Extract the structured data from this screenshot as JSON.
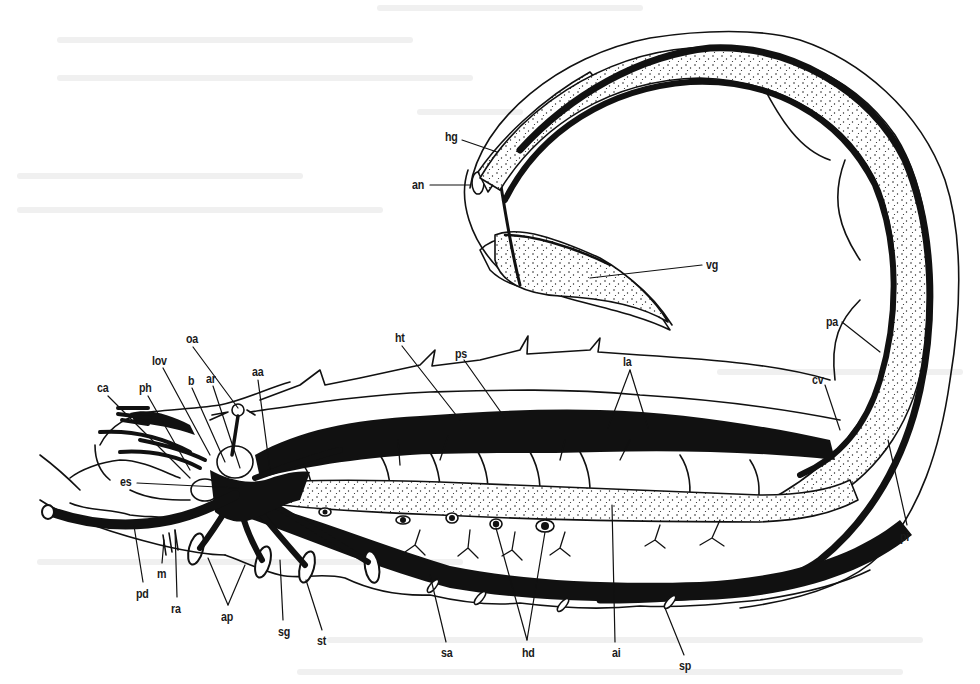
{
  "diagram": {
    "style": "black ink line drawing, blood vessels filled black, gut stippled",
    "colors": {
      "ink": "#111111",
      "paper": "#ffffff",
      "stipple": "#222222"
    }
  },
  "labels": [
    {
      "id": "hg",
      "text": "hg",
      "x": 445,
      "y": 130
    },
    {
      "id": "an",
      "text": "an",
      "x": 412,
      "y": 178
    },
    {
      "id": "vg",
      "text": "vg",
      "x": 706,
      "y": 258
    },
    {
      "id": "pa",
      "text": "pa",
      "x": 826,
      "y": 315
    },
    {
      "id": "cv",
      "text": "cv",
      "x": 812,
      "y": 373
    },
    {
      "id": "pi",
      "text": "pi",
      "x": 900,
      "y": 530
    },
    {
      "id": "ht",
      "text": "ht",
      "x": 395,
      "y": 331
    },
    {
      "id": "ps",
      "text": "ps",
      "x": 455,
      "y": 347
    },
    {
      "id": "la",
      "text": "la",
      "x": 623,
      "y": 355
    },
    {
      "id": "oa",
      "text": "oa",
      "x": 186,
      "y": 332
    },
    {
      "id": "lov",
      "text": "lov",
      "x": 152,
      "y": 354
    },
    {
      "id": "b",
      "text": "b",
      "x": 188,
      "y": 374
    },
    {
      "id": "ar",
      "text": "ar",
      "x": 206,
      "y": 372
    },
    {
      "id": "aa",
      "text": "aa",
      "x": 252,
      "y": 365
    },
    {
      "id": "ca",
      "text": "ca",
      "x": 97,
      "y": 381
    },
    {
      "id": "ph",
      "text": "ph",
      "x": 139,
      "y": 381
    },
    {
      "id": "es",
      "text": "es",
      "x": 120,
      "y": 475
    },
    {
      "id": "m",
      "text": "m",
      "x": 157,
      "y": 567
    },
    {
      "id": "pd",
      "text": "pd",
      "x": 136,
      "y": 587
    },
    {
      "id": "ra",
      "text": "ra",
      "x": 171,
      "y": 602
    },
    {
      "id": "ap",
      "text": "ap",
      "x": 221,
      "y": 610
    },
    {
      "id": "sg",
      "text": "sg",
      "x": 278,
      "y": 625
    },
    {
      "id": "st",
      "text": "st",
      "x": 317,
      "y": 634
    },
    {
      "id": "sa",
      "text": "sa",
      "x": 441,
      "y": 646
    },
    {
      "id": "hd",
      "text": "hd",
      "x": 522,
      "y": 646
    },
    {
      "id": "ai",
      "text": "ai",
      "x": 612,
      "y": 646
    },
    {
      "id": "sp",
      "text": "sp",
      "x": 679,
      "y": 659
    }
  ]
}
